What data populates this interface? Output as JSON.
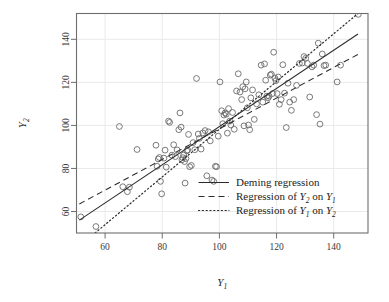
{
  "chart_data": {
    "type": "scatter",
    "title": "",
    "subtitle": "",
    "xlabel": "Y1",
    "ylabel": "Y2",
    "xlabel_base": "Y",
    "xlabel_sub": "1",
    "ylabel_base": "Y",
    "ylabel_sub": "2",
    "xlim": [
      50,
      152
    ],
    "ylim": [
      50,
      152
    ],
    "xticks": [
      60,
      80,
      100,
      120,
      140
    ],
    "yticks": [
      60,
      80,
      100,
      120,
      140
    ],
    "xtick_labels": [
      "60",
      "80",
      "100",
      "120",
      "140"
    ],
    "ytick_labels": [
      "60",
      "80",
      "100",
      "120",
      "140"
    ],
    "grid": true,
    "grid_color": "#e9e9e9",
    "panel_border_color": "#6e6e6e",
    "point_color": "#6b6b6b",
    "point_marker": "open-circle",
    "point_radius": 2.9,
    "legend_position": "bottom-right",
    "points": [
      [
        51.5,
        57.5
      ],
      [
        56.8,
        53.0
      ],
      [
        65.0,
        99.5
      ],
      [
        67.8,
        69.2
      ],
      [
        66.2,
        71.5
      ],
      [
        68.5,
        71.3
      ],
      [
        71.2,
        88.8
      ],
      [
        77.8,
        90.8
      ],
      [
        78.2,
        81.0
      ],
      [
        78.6,
        84.4
      ],
      [
        79.0,
        85.1
      ],
      [
        79.4,
        74.0
      ],
      [
        79.8,
        68.2
      ],
      [
        80.6,
        84.8
      ],
      [
        81.0,
        88.5
      ],
      [
        81.4,
        80.6
      ],
      [
        82.2,
        102.0
      ],
      [
        82.6,
        101.4
      ],
      [
        83.4,
        86.2
      ],
      [
        84.0,
        91.0
      ],
      [
        84.6,
        85.5
      ],
      [
        85.2,
        88.6
      ],
      [
        85.8,
        98.0
      ],
      [
        86.2,
        105.8
      ],
      [
        86.6,
        99.2
      ],
      [
        86.9,
        84.0
      ],
      [
        87.2,
        85.0
      ],
      [
        87.5,
        86.2
      ],
      [
        87.8,
        83.2
      ],
      [
        88.0,
        73.2
      ],
      [
        88.3,
        84.6
      ],
      [
        88.6,
        88.2
      ],
      [
        88.9,
        88.6
      ],
      [
        89.2,
        95.8
      ],
      [
        89.6,
        80.8
      ],
      [
        90.2,
        81.4
      ],
      [
        90.8,
        92.0
      ],
      [
        91.4,
        88.7
      ],
      [
        92.0,
        121.8
      ],
      [
        92.6,
        96.0
      ],
      [
        93.0,
        94.0
      ],
      [
        93.6,
        89.0
      ],
      [
        94.2,
        96.5
      ],
      [
        95.0,
        97.6
      ],
      [
        95.6,
        76.6
      ],
      [
        96.2,
        97.0
      ],
      [
        96.8,
        92.8
      ],
      [
        97.4,
        74.6
      ],
      [
        98.0,
        74.0
      ],
      [
        98.6,
        81.0
      ],
      [
        99.0,
        80.8
      ],
      [
        99.6,
        95.0
      ],
      [
        100.2,
        120.2
      ],
      [
        100.8,
        106.8
      ],
      [
        101.2,
        100.8
      ],
      [
        101.6,
        104.8
      ],
      [
        102.0,
        105.8
      ],
      [
        102.4,
        105.2
      ],
      [
        102.8,
        96.4
      ],
      [
        103.2,
        107.8
      ],
      [
        103.6,
        102.0
      ],
      [
        104.0,
        100.2
      ],
      [
        104.6,
        106.0
      ],
      [
        105.2,
        98.2
      ],
      [
        106.0,
        116.0
      ],
      [
        106.6,
        124.0
      ],
      [
        107.2,
        115.5
      ],
      [
        107.8,
        112.0
      ],
      [
        108.2,
        118.0
      ],
      [
        108.6,
        99.8
      ],
      [
        109.0,
        117.0
      ],
      [
        109.4,
        120.2
      ],
      [
        109.8,
        108.2
      ],
      [
        110.2,
        100.2
      ],
      [
        110.6,
        98.0
      ],
      [
        111.0,
        112.8
      ],
      [
        111.6,
        116.5
      ],
      [
        112.2,
        102.8
      ],
      [
        113.0,
        110.0
      ],
      [
        113.8,
        114.2
      ],
      [
        114.6,
        128.0
      ],
      [
        115.2,
        110.8
      ],
      [
        115.8,
        128.6
      ],
      [
        116.2,
        121.0
      ],
      [
        116.6,
        113.6
      ],
      [
        117.0,
        112.8
      ],
      [
        117.4,
        113.6
      ],
      [
        117.8,
        123.4
      ],
      [
        118.2,
        123.8
      ],
      [
        118.6,
        114.8
      ],
      [
        119.0,
        134.0
      ],
      [
        119.4,
        122.0
      ],
      [
        119.8,
        120.8
      ],
      [
        120.2,
        114.8
      ],
      [
        120.6,
        122.5
      ],
      [
        121.0,
        109.8
      ],
      [
        121.6,
        112.0
      ],
      [
        122.2,
        128.2
      ],
      [
        122.8,
        115.0
      ],
      [
        123.4,
        99.0
      ],
      [
        124.0,
        119.6
      ],
      [
        124.6,
        110.8
      ],
      [
        125.2,
        107.0
      ],
      [
        126.0,
        112.0
      ],
      [
        127.0,
        118.6
      ],
      [
        128.0,
        128.8
      ],
      [
        129.0,
        129.0
      ],
      [
        129.6,
        132.0
      ],
      [
        130.2,
        131.2
      ],
      [
        130.8,
        128.8
      ],
      [
        131.6,
        113.2
      ],
      [
        132.4,
        127.2
      ],
      [
        133.0,
        128.0
      ],
      [
        134.0,
        105.0
      ],
      [
        134.6,
        138.2
      ],
      [
        135.2,
        100.6
      ],
      [
        136.0,
        133.2
      ],
      [
        136.6,
        127.8
      ],
      [
        137.2,
        128.0
      ],
      [
        141.2,
        120.2
      ],
      [
        142.4,
        128.0
      ],
      [
        148.6,
        151.6
      ]
    ],
    "series": [
      {
        "name": "Deming regression",
        "style": "solid",
        "type": "line",
        "endpoints": [
          [
            51.0,
            56.0
          ],
          [
            148.5,
            142.5
          ]
        ]
      },
      {
        "name": "Regression of Y2 on Y1",
        "style": "dashed",
        "type": "line",
        "endpoints": [
          [
            51.0,
            63.5
          ],
          [
            148.5,
            133.0
          ]
        ]
      },
      {
        "name": "Regression of Y1 on Y2",
        "style": "dotted",
        "type": "line",
        "endpoints": [
          [
            56.5,
            50.0
          ],
          [
            148.5,
            152.0
          ]
        ]
      }
    ],
    "legend": [
      {
        "label": "Deming regression",
        "style": "solid"
      },
      {
        "label": "Regression of Y2 on Y1",
        "style": "dashed",
        "prefix": "Regression of ",
        "v1": "Y",
        "s1": "2",
        "mid": " on ",
        "v2": "Y",
        "s2": "1"
      },
      {
        "label": "Regression of Y1 on Y2",
        "style": "dotted",
        "prefix": "Regression of ",
        "v1": "Y",
        "s1": "1",
        "mid": " on ",
        "v2": "Y",
        "s2": "2"
      }
    ]
  }
}
